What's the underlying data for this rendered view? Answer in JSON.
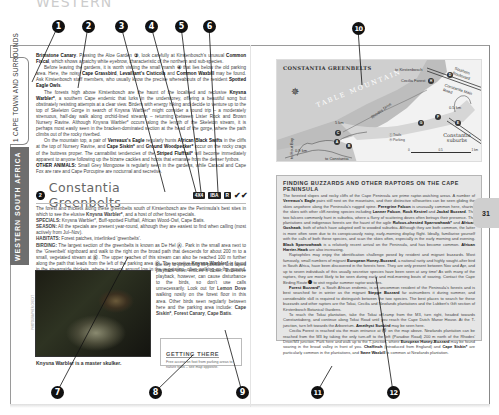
{
  "top_title": "WESTERN",
  "sidebar": {
    "chapter_tab": "1  CAPE TOWN AND SURROUNDS",
    "region_tab": "WESTERN SOUTH AFRICA"
  },
  "left_page": {
    "intro_paragraphs": [
      {
        "html": "<b>Brimstone Canary</b>. Passing the Aloe Garden <b>③</b>, look carefully at Kirstenbosch's unusual <b>Common Fiscal</b>, which shows a patchy white eyebrow, characteristic of the northern and sub-species."
      },
      {
        "html": "Before leaving the gardens, it is worth visiting the small marsh <b>④</b> that lies below the old parking area. Here, the noisy <b>Cape Grassbird</b>, <b>Levaillant's Cisticola</b> and <b>Common Waxbill</b> may be found. Ask Kirstenbosch staff members, who usually know the precise whereabouts of the resident <b>Spotted Eagle Owls</b>.",
        "indent": true
      },
      {
        "html": "The forests high above Kirstenbosch are the haunt of the localised and reclusive <b>Knysna Warbler*</b>, a southern Cape endemic that lurks in the understorey, offering a beautiful song but obstinately resisting attempts at a clear view. Birders with energy hiking and decide to venture up to the top of Skeleton Gorge in search of Knysna Warbler* might consider a round trip – a moderately strenuous, half-day walk along orchid-lined streams – returning between Lister Rock and Brown Nursery Ravine. Although Knysna Warbler* occurs along the length of the Skeleton stream, it is perhaps most easily seen in the bracken-dominated section at the head of the gorge, where the path climbs out of the rocky riverbed.",
        "indent": true
      },
      {
        "html": "On the mountain top, a pair of <b>Verreaux's Eagle</b> regularly hunts <b>African Black Swifts</b> in the cliffs at the top of Nursery Ravine, and <b>Cape Siskin*</b> and <b>Ground Woodpecker*</b> occur on the rocky crags of the buttress proper. The cannabilist tendencies of the <b>Striped Flufftail*</b> will become immediately apparent to anyone following up the bizarre cackles and hoots that emanate from the denser fynbos.",
        "indent": true
      },
      {
        "html": "<b>OTHER ANIMALS:</b> Small Grey Mongoose is regularly seen in the gardens, while Caracal and Cape Fox are rare and Cape Porcupine are nocturnal and secretive."
      }
    ],
    "site": {
      "number": "2",
      "title": "Constantia Greenbelts",
      "badges": [
        "4X4",
        "IBA",
        "R"
      ],
      "ticks": "✔✔"
    },
    "site_paragraphs": [
      {
        "html": "The forest and thickets along these greenbelts south of Kirstenbosch are the Peninsula's best sites in which to see the elusive <b>Knysna Warbler*</b>, and a host of other forest specials."
      },
      {
        "html": "<b>SPECIALS:</b> Knysna Warbler*, Buff-spotted Flufftail, African Wood-Owl, Cape Batis."
      },
      {
        "html": "<b>SEASON:</b> All the specials are present year-round, although they are easiest to find when calling (most actively from Jul–Nov)."
      },
      {
        "html": "<b>HABITATS:</b> Forest patches, interlinked 'greenbelts'."
      },
      {
        "html": "<b>BIRDING:</b> The largest section of the greenbelts is known as De Hel <b>Ⓐ</b>. Park in the small area next to the 'Greenbelt' signboard and walk to the right on the broad path that descends for about 200 m to a small, vegetated stream at <b>Ⓑ</b>. The upper reaches of this stream can also be reached 100 m further along the path that leads from the left of the parking area <b>Ⓒ</b>. The secretive <b>Knysna Warbler*</b> is found in the streamside thickets, where it creeps around low in the vegetation, often walking on the ground. This sombre skulker's strikingly beautiful song is"
      }
    ],
    "continued_text": "the key to pinpointing its position, and taped playback often entices it closer. Excessive playback, however, can cause disturbance to the birds, so don't use calls unnecessarily. Look out for <b>Lemon Dove</b> walking nosily on the forest floor in this area. Other birds seen regularly between here and the parking area include: <b>Cape Siskin*</b>, <b>Forest Canary</b>, <b>Cape Batis</b>.",
    "photo": {
      "caption": "Knysna Warbler is a master skulker.",
      "credit": "PHOTOGRAPHER CREDIT"
    },
    "getting_there": {
      "title": "GETTING THERE",
      "body": "Free access on foot from parking areas to nature trails – see map opposite."
    }
  },
  "map": {
    "title": "CONSTANTIA GREENBELTS",
    "mountain_label": "TABLE MOUNTAIN",
    "labels": {
      "to_kirstenbosch": "to Kirstenbosch",
      "cecilia_forest": "Cecilia Forest",
      "rhodes_drive": "Rhodes Drive",
      "southern_boulevard": "Southern Boulevard",
      "constantia_main_road": "Constantia Main Road",
      "dist_1": "5 km",
      "dist_2": "0.5 km",
      "dist_3": "0.9 km",
      "dist_4": "1 km",
      "to_constantia": "to Constantia",
      "to_hout_bay": "to Hout Bay"
    },
    "pins": [
      "A",
      "B",
      "C",
      "D",
      "E",
      "F",
      "G",
      "H"
    ],
    "legend": [
      {
        "symbol": "Ⓣ",
        "label": "Trails"
      },
      {
        "symbol": "Ⓟ",
        "label": "Parking"
      }
    ],
    "suburb": "Constantia suburbs",
    "scale": [
      "0",
      "0.5",
      "1 km"
    ]
  },
  "raptor_box": {
    "title": "FINDING BUZZARDS AND OTHER RAPTORS ON THE CAPE PENINSULA",
    "paragraphs": [
      {
        "html": "The forested slopes and rocky cliffs of the Cape Peninsula are prime raptor-watching areas. A number of <b>Verreaux's Eagle</b> pairs still nest on the mountains, and their distinctive silhouettes can be seen gliding the skies anywhere along the Peninsula's rugged spine. <b>Peregrine Falcon</b> is unusually common here, sharing the skies with other cliff-nesting species including <b>Lanner Falcon</b>, <b>Rock Kestrel</b> and <b>Jackal Buzzard</b>. The two falcons commonly hunt in suburbia, where a flurry of scattering doves often betrays their presence. The plantations and indigenous forests are the haunt of the agile <b>Rufous-chested Sparrowhawk*</b> and <b>African Goshawk</b>, both of which have adapted well to wooded suburbia. Although they are both common, the latter is more often seen due to its conspicuously noisy, early-morning display flight. Ideally, familiarise yourself with the calls of both these species, and scan the skies often, especially in the early morning and evening. <b>Black Sparrowhawk</b> is a relatively recent arrival on the Peninsula, and has become common. <b>African Harrier-Hawk</b> are also increasing."
      },
      {
        "html": "Raptophiles may enjoy the identification challenge posed by resident and migrant buzzards. Most famously, small numbers of migrant <b>European Honey-Buzzard</b>, a national rarity and highly sought-after bird in South Africa, have been discovered in the forests here. They are only present between Nov and Apr, and up to seven individuals of this usually secretive species have been seen at any time! As with many of the raptors, they are most likely to be seen during early and mid-morning bouts of soaring. Contact the Cape Birding Route <b>⓬</b> to visit regular summer raptor watches.",
        "indent": true
      },
      {
        "html": "<b>Forest Buzzard*</b>, a South African endemic, is an uncommon resident of the Peninsula's forests and is best searched for in winter as the migrant <b>Steppe Buzzard</b> far outnumbers it during summer, and considerable skill is required to distinguish between the two species. The best places to search for these buzzards and other raptors are the Tokai, Cecilia and Newlands plantations and the Lubbert's Gift section of Kirstenbosch Botanical Gardens.",
        "indent": true
      },
      {
        "html": "To reach the Tokai plantation, take the Tokai off-ramp from the M3, turn right, headed towards Constantiaberg, and continue along Tokai Road until you reach the Cape Dutch Manor House. At the T-junction, turn left towards the Arboretum. <b>Amethyst Sunbird</b> may be seen here.",
        "indent": true
      },
      {
        "html": "Cecilia Forest is reached via the main entrance at <b>Ⓗ</b> on the map above. Newlands plantation can be reached from the M3 by taking the only turn-off to the left (Paradise Road) 200 m north of the Rhodes' Drive/M3 junction. Park here and walk up to the T-junction, where <b>European Honey-Buzzard</b> may be found soaring in the broad valley in front of you. <b>Chaffinch</b> (introduced from England) and <b>Cape Siskin*</b> are particularly common in the plantations, and <b>Swee Waxbill</b> is common at Newlands plantation.",
        "indent": true
      }
    ]
  },
  "page_number": "31",
  "callouts": [
    "1",
    "2",
    "3",
    "4",
    "5",
    "6",
    "7",
    "8",
    "9",
    "10",
    "11",
    "12"
  ],
  "colors": {
    "sidebar_dark": "#6e6e6e",
    "box_fill": "#e6e6e6",
    "callout": "#111111",
    "page_tab": "#cfcfcf"
  }
}
